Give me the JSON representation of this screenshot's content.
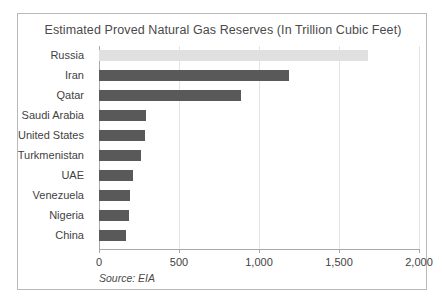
{
  "chart_data": {
    "type": "bar",
    "orientation": "horizontal",
    "title": "Estimated Proved Natural Gas Reserves (In Trillion Cubic Feet)",
    "xlabel": "",
    "ylabel": "",
    "xlim": [
      0,
      2000
    ],
    "xticks": [
      0,
      500,
      1000,
      1500,
      2000
    ],
    "xtick_labels": [
      "0",
      "500",
      "1,000",
      "1,500",
      "2,000"
    ],
    "grid": true,
    "legend": false,
    "source_note": "Source: EIA",
    "categories": [
      "Russia",
      "Iran",
      "Qatar",
      "Saudi Arabia",
      "United States",
      "Turkmenistan",
      "UAE",
      "Venezuela",
      "Nigeria",
      "China"
    ],
    "values": [
      1680,
      1190,
      890,
      295,
      290,
      265,
      215,
      195,
      185,
      170
    ],
    "bar_colors": [
      "#e0e0e0",
      "#595959",
      "#595959",
      "#595959",
      "#595959",
      "#595959",
      "#595959",
      "#595959",
      "#595959",
      "#595959"
    ],
    "highlight_index": 0,
    "colors": {
      "bar_default": "#595959",
      "bar_highlight": "#e0e0e0",
      "gridline": "#e4e4e4",
      "axis": "#a8a8a8",
      "frame_border": "#b9b9b9",
      "text": "#3f3f3f",
      "background": "#ffffff"
    }
  }
}
